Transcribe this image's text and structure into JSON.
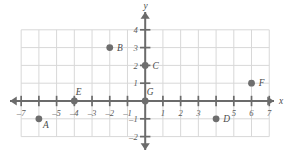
{
  "figure": {
    "type": "coordinate-plane",
    "background_color": "#ffffff",
    "grid_color": "#d8d8d8",
    "axis_color": "#6b6b6b",
    "point_color": "#6e6e6e",
    "label_color": "#4a4a4a"
  },
  "axes": {
    "x_axis_label": "x",
    "y_axis_label": "y",
    "x_min": -7,
    "x_max": 7,
    "y_min": -2,
    "y_max": 4,
    "x_tick_labels": [
      "–7",
      "–5",
      "–4",
      "–3",
      "–2",
      "–1",
      "1",
      "2",
      "3",
      "5",
      "6",
      "7"
    ],
    "x_tick_values": [
      -7,
      -5,
      -4,
      -3,
      -2,
      -1,
      1,
      2,
      3,
      5,
      6,
      7
    ],
    "y_tick_labels": [
      "4",
      "3",
      "2",
      "1",
      "–1",
      "–2"
    ],
    "y_tick_values": [
      4,
      3,
      2,
      1,
      -1,
      -2
    ],
    "hidden_x_tick_labels": [
      -6,
      4
    ],
    "arrows": [
      "left",
      "right",
      "up",
      "down"
    ]
  },
  "chart_data": {
    "type": "scatter",
    "title": "",
    "xlabel": "x",
    "ylabel": "y",
    "xlim": [
      -7,
      7
    ],
    "ylim": [
      -2,
      4
    ],
    "grid": true,
    "legend": "none",
    "points": [
      {
        "label": "A",
        "x": -6,
        "y": -1,
        "label_pos": "right-below"
      },
      {
        "label": "B",
        "x": -2,
        "y": 3,
        "label_pos": "right"
      },
      {
        "label": "C",
        "x": 0,
        "y": 2,
        "label_pos": "right"
      },
      {
        "label": "D",
        "x": 4,
        "y": -1,
        "label_pos": "right"
      },
      {
        "label": "E",
        "x": -4,
        "y": 0,
        "label_pos": "right-above"
      },
      {
        "label": "F",
        "x": 6,
        "y": 1,
        "label_pos": "right"
      },
      {
        "label": "G",
        "x": 0,
        "y": 0,
        "label_pos": "right-above"
      }
    ]
  }
}
